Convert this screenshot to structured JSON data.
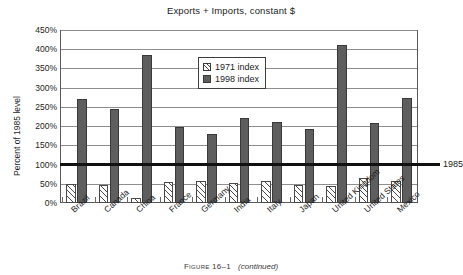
{
  "chart_data": {
    "type": "bar",
    "title": "Exports + Imports, constant $",
    "xlabel": "",
    "ylabel": "Percent of 1985 level",
    "ylim": [
      0,
      450
    ],
    "ytick_step": 50,
    "ytick_labels": [
      "450%",
      "400%",
      "350%",
      "300%",
      "250%",
      "200%",
      "150%",
      "100%",
      "50%",
      "0%"
    ],
    "grid": true,
    "legend_position": "inside-top-center",
    "categories": [
      "Brazil",
      "Canada",
      "China",
      "France",
      "Germany",
      "India",
      "Italy",
      "Japan",
      "United Kingdom",
      "United States",
      "Mexico"
    ],
    "series": [
      {
        "name": "1971 index",
        "values": [
          50,
          48,
          12,
          54,
          58,
          52,
          57,
          48,
          44,
          65,
          57
        ]
      },
      {
        "name": "1998 index",
        "values": [
          270,
          244,
          385,
          198,
          180,
          222,
          210,
          192,
          410,
          207,
          273
        ]
      }
    ],
    "reference_line": {
      "value": 100,
      "label": "1985"
    }
  },
  "figure": {
    "caption_number": "Figure 16–1",
    "caption_note": "(continued)"
  },
  "colors": {
    "series_1971": "#ffffff",
    "series_1998": "#5e5e5e",
    "grid": "#8e8e8e",
    "reference_line": "#111111",
    "frame": "#5a5a5a"
  }
}
